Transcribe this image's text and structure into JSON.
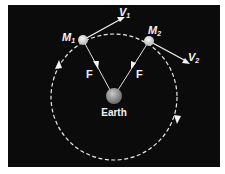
{
  "diagram": {
    "title": "",
    "colors": {
      "background": "#0b0b0b",
      "lines": "#e8e8e8",
      "earth": "#8a8a8a",
      "moon": "#d8d8d8"
    },
    "orbit": {
      "style": "dashed",
      "direction": "clockwise"
    },
    "bodies": {
      "earth": {
        "label": "Earth"
      },
      "m1": {
        "label": "M",
        "subscript": "1"
      },
      "m2": {
        "label": "M",
        "subscript": "2"
      }
    },
    "vectors": {
      "v1": {
        "label": "V",
        "subscript": "1"
      },
      "v2": {
        "label": "V",
        "subscript": "2"
      },
      "f1": {
        "label": "F"
      },
      "f2": {
        "label": "F"
      }
    }
  }
}
